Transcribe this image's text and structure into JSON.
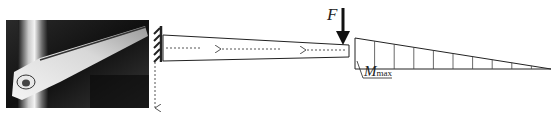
{
  "figure": {
    "photo": {
      "subject": "wing spar / lever arm photograph",
      "tone": "grayscale"
    },
    "beam": {
      "type": "tapered cantilever beam",
      "support": "fixed wall (hatched) at left",
      "flow_arrows": 3,
      "flow_direction": "right-to-left",
      "reaction_arrow": "downward dashed arrow below support"
    },
    "load": {
      "symbol": "F",
      "direction": "down",
      "location": "free end (right)"
    },
    "moment_diagram": {
      "shape": "triangle decreasing from left to right",
      "divisions": 10,
      "label_main": "M",
      "label_sub": "max"
    },
    "colors": {
      "line": "#222222",
      "dashed": "#555555",
      "background": "#ffffff"
    }
  }
}
